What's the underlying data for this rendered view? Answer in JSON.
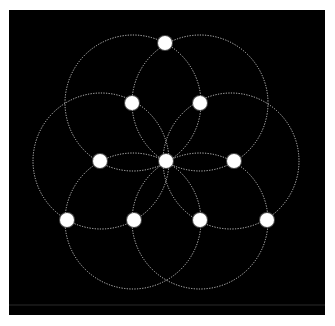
{
  "diagram": {
    "type": "flower-of-life-pattern",
    "canvas": {
      "x": 9,
      "y": 10,
      "width": 316,
      "height": 305,
      "background": "#000000"
    },
    "baseline": {
      "x1": 9,
      "x2": 325,
      "y": 305,
      "color": "#2a2a2a"
    },
    "circle_style": {
      "stroke": "#c8c8c8",
      "stroke_width": 1,
      "dash": "1.2 1.4"
    },
    "dot_style": {
      "fill": "#ffffff",
      "radius": 7
    },
    "circles": [
      {
        "cx": 133,
        "cy": 103,
        "r": 68
      },
      {
        "cx": 200,
        "cy": 103,
        "r": 68
      },
      {
        "cx": 101,
        "cy": 161,
        "r": 68
      },
      {
        "cx": 231,
        "cy": 161,
        "r": 68
      },
      {
        "cx": 133,
        "cy": 221,
        "r": 68
      },
      {
        "cx": 200,
        "cy": 221,
        "r": 68
      }
    ],
    "dots": [
      {
        "cx": 165,
        "cy": 43
      },
      {
        "cx": 132,
        "cy": 103
      },
      {
        "cx": 200,
        "cy": 103
      },
      {
        "cx": 100,
        "cy": 161
      },
      {
        "cx": 166,
        "cy": 161
      },
      {
        "cx": 234,
        "cy": 161
      },
      {
        "cx": 67,
        "cy": 220
      },
      {
        "cx": 134,
        "cy": 220
      },
      {
        "cx": 200,
        "cy": 220
      },
      {
        "cx": 267,
        "cy": 220
      }
    ]
  }
}
